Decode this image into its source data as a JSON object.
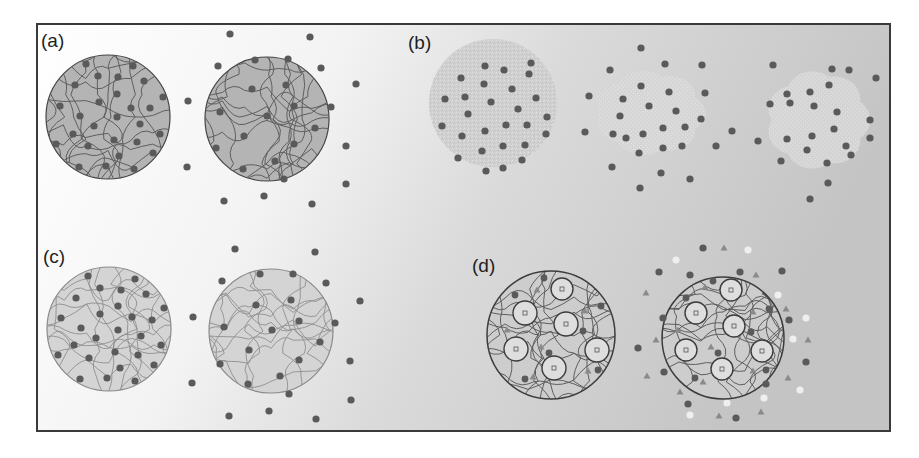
{
  "figure": {
    "frame": {
      "x": 37,
      "y": 24,
      "width": 853,
      "height": 407,
      "stroke": "#3a3a3a"
    },
    "background": {
      "gradient_stops": [
        "#ffffff",
        "#f1f1f1",
        "#d6d6d6",
        "#c2c2c2"
      ]
    },
    "colors": {
      "dot": "#5a5a5a",
      "triangle": "#8a8a8a",
      "light_dot": "#efefef",
      "strand": "#5e5e5e",
      "outline": "#444444",
      "a_fill": "#b4b4b4",
      "b_fill": "#cfcfcf",
      "c_fill": "#d4d4d4",
      "d_fill": "#cdcdcd",
      "d_inner_fill": "#dedede"
    },
    "panels": [
      {
        "label": "(a)",
        "label_pos": [
          41,
          47
        ],
        "description": "Dense gray sphere with polymer network and loaded dots; swollen sphere releasing dots",
        "spheres": [
          {
            "cx": 108,
            "cy": 117,
            "r": 62,
            "style": "network-dark"
          },
          {
            "cx": 267,
            "cy": 119,
            "r": 62,
            "style": "network-dark"
          }
        ],
        "dots_inside": [
          [
            [
              86,
              64
            ],
            [
              133,
              66
            ],
            [
              98,
              76
            ],
            [
              118,
              77
            ],
            [
              144,
              81
            ],
            [
              75,
              85
            ],
            [
              117,
              94
            ],
            [
              60,
              106
            ],
            [
              99,
              102
            ],
            [
              131,
              108
            ],
            [
              150,
              108
            ],
            [
              163,
              97
            ],
            [
              80,
              116
            ],
            [
              117,
              117
            ],
            [
              94,
              126
            ],
            [
              140,
              124
            ],
            [
              73,
              134
            ],
            [
              114,
              140
            ],
            [
              137,
              142
            ],
            [
              160,
              134
            ],
            [
              56,
              144
            ],
            [
              88,
              146
            ],
            [
              153,
              153
            ],
            [
              119,
              156
            ],
            [
              79,
              167
            ],
            [
              106,
              166
            ],
            [
              134,
              169
            ]
          ],
          [
            [
              255,
              60
            ],
            [
              288,
              59
            ],
            [
              252,
              89
            ],
            [
              286,
              85
            ],
            [
              220,
              112
            ],
            [
              294,
              106
            ],
            [
              267,
              116
            ],
            [
              315,
              128
            ],
            [
              244,
              136
            ],
            [
              294,
              144
            ],
            [
              216,
              148
            ],
            [
              275,
              161
            ],
            [
              243,
              169
            ]
          ]
        ],
        "dots_outside": [
          [
            230,
            34
          ],
          [
            310,
            37
          ],
          [
            218,
            66
          ],
          [
            321,
            68
          ],
          [
            356,
            84
          ],
          [
            188,
            101
          ],
          [
            331,
            107
          ],
          [
            346,
            146
          ],
          [
            187,
            167
          ],
          [
            284,
            179
          ],
          [
            346,
            184
          ],
          [
            224,
            201
          ],
          [
            264,
            196
          ],
          [
            312,
            204
          ]
        ]
      },
      {
        "label": "(b)",
        "label_pos": [
          408,
          49
        ],
        "description": "Nanoparticle cluster that fragments and disperses over time",
        "spheres": [
          {
            "cx": 493,
            "cy": 103,
            "r": 64,
            "style": "speckled"
          }
        ],
        "blobs": [
          {
            "cx": 650,
            "cy": 113,
            "rx": 62,
            "ry": 50
          },
          {
            "cx": 818,
            "cy": 120,
            "rx": 58,
            "ry": 58
          }
        ],
        "dots_inside": [
          [
            [
              485,
              66
            ],
            [
              504,
              70
            ],
            [
              529,
              74
            ],
            [
              461,
              78
            ],
            [
              484,
              84
            ],
            [
              512,
              89
            ],
            [
              445,
              99
            ],
            [
              465,
              97
            ],
            [
              491,
              102
            ],
            [
              518,
              109
            ],
            [
              536,
              98
            ],
            [
              468,
              114
            ],
            [
              547,
              117
            ],
            [
              442,
              126
            ],
            [
              506,
              125
            ],
            [
              527,
              125
            ],
            [
              462,
              136
            ],
            [
              485,
              131
            ],
            [
              546,
              134
            ],
            [
              482,
              151
            ],
            [
              503,
              146
            ],
            [
              525,
              145
            ],
            [
              458,
              158
            ],
            [
              522,
              160
            ],
            [
              486,
              171
            ],
            [
              503,
              168
            ]
          ]
        ],
        "dots_outside": [
          [
            641,
            48
          ],
          [
            531,
            63
          ],
          [
            610,
            70
          ],
          [
            665,
            64
          ],
          [
            702,
            65
          ],
          [
            773,
            65
          ],
          [
            832,
            69
          ],
          [
            849,
            70
          ],
          [
            876,
            78
          ],
          [
            589,
            96
          ],
          [
            623,
            99
          ],
          [
            641,
            86
          ],
          [
            669,
            92
          ],
          [
            705,
            93
          ],
          [
            787,
            94
          ],
          [
            810,
            92
          ],
          [
            829,
            85
          ],
          [
            620,
            116
          ],
          [
            649,
            106
          ],
          [
            676,
            111
          ],
          [
            701,
            119
          ],
          [
            770,
            104
          ],
          [
            790,
            103
          ],
          [
            814,
            106
          ],
          [
            837,
            112
          ],
          [
            613,
            134
          ],
          [
            626,
            138
          ],
          [
            663,
            128
          ],
          [
            685,
            127
          ],
          [
            732,
            131
          ],
          [
            834,
            129
          ],
          [
            870,
            120
          ],
          [
            870,
            138
          ],
          [
            585,
            132
          ],
          [
            643,
            134
          ],
          [
            663,
            148
          ],
          [
            682,
            146
          ],
          [
            716,
            146
          ],
          [
            758,
            141
          ],
          [
            787,
            139
          ],
          [
            812,
            136
          ],
          [
            807,
            150
          ],
          [
            846,
            146
          ],
          [
            612,
            167
          ],
          [
            639,
            153
          ],
          [
            661,
            173
          ],
          [
            690,
            179
          ],
          [
            781,
            161
          ],
          [
            827,
            163
          ],
          [
            851,
            155
          ],
          [
            640,
            188
          ],
          [
            828,
            183
          ],
          [
            810,
            199
          ]
        ]
      },
      {
        "label": "(c)",
        "label_pos": [
          43,
          263
        ],
        "description": "Light sphere with sparse network, swollen and releasing dots",
        "spheres": [
          {
            "cx": 109,
            "cy": 329,
            "r": 62,
            "style": "network-light"
          },
          {
            "cx": 271,
            "cy": 331,
            "r": 62,
            "style": "network-light"
          }
        ],
        "dots_inside": [
          [
            [
              88,
              276
            ],
            [
              135,
              279
            ],
            [
              100,
              288
            ],
            [
              121,
              290
            ],
            [
              146,
              294
            ],
            [
              76,
              298
            ],
            [
              118,
              306
            ],
            [
              61,
              318
            ],
            [
              100,
              314
            ],
            [
              132,
              317
            ],
            [
              152,
              320
            ],
            [
              164,
              308
            ],
            [
              81,
              328
            ],
            [
              118,
              330
            ],
            [
              96,
              338
            ],
            [
              141,
              336
            ],
            [
              74,
              345
            ],
            [
              115,
              352
            ],
            [
              138,
              355
            ],
            [
              161,
              345
            ],
            [
              58,
              355
            ],
            [
              89,
              358
            ],
            [
              154,
              365
            ],
            [
              120,
              368
            ],
            [
              80,
              379
            ],
            [
              107,
              378
            ],
            [
              135,
              381
            ]
          ]
        ],
        "dots_outside": [
          [
            235,
            249
          ],
          [
            315,
            252
          ],
          [
            222,
            281
          ],
          [
            326,
            283
          ],
          [
            360,
            301
          ],
          [
            193,
            317
          ],
          [
            335,
            323
          ],
          [
            350,
            361
          ],
          [
            192,
            383
          ],
          [
            289,
            394
          ],
          [
            351,
            400
          ],
          [
            229,
            416
          ],
          [
            269,
            411
          ],
          [
            316,
            419
          ],
          [
            260,
            274
          ],
          [
            293,
            274
          ],
          [
            256,
            305
          ],
          [
            291,
            300
          ],
          [
            224,
            327
          ],
          [
            299,
            321
          ],
          [
            272,
            330
          ],
          [
            320,
            342
          ],
          [
            249,
            350
          ],
          [
            299,
            360
          ],
          [
            220,
            364
          ],
          [
            280,
            376
          ],
          [
            248,
            384
          ]
        ]
      },
      {
        "label": "(d)",
        "label_pos": [
          472,
          272
        ],
        "description": "Network sphere with encapsulated vesicles, dots and triangles; swollen and releasing both species",
        "spheres": [
          {
            "cx": 551,
            "cy": 335,
            "r": 64,
            "style": "network-vesicles"
          },
          {
            "cx": 723,
            "cy": 338,
            "r": 61,
            "style": "network-vesicles"
          }
        ],
        "vesicles": [
          [
            [
              562,
              289,
              11
            ],
            [
              525,
              313,
              12
            ],
            [
              566,
              324,
              12
            ],
            [
              516,
              349,
              12
            ],
            [
              597,
              350,
              12
            ],
            [
              554,
              368,
              12
            ]
          ],
          [
            [
              731,
              290,
              11
            ],
            [
              696,
              313,
              11
            ],
            [
              734,
              326,
              11
            ],
            [
              686,
              350,
              11
            ],
            [
              762,
              351,
              11
            ],
            [
              722,
              369,
              11
            ]
          ]
        ],
        "dots_inside": [
          [
            [
              544,
              278
            ],
            [
              515,
              295
            ],
            [
              601,
              306
            ],
            [
              583,
              331
            ],
            [
              549,
              353
            ],
            [
              598,
              370
            ],
            [
              525,
              379
            ]
          ],
          [
            [
              713,
              281
            ],
            [
              686,
              298
            ],
            [
              769,
              309
            ],
            [
              751,
              332
            ],
            [
              718,
              353
            ],
            [
              766,
              370
            ],
            [
              695,
              378
            ]
          ]
        ],
        "triangles_inside": [
          [
            [
              537,
              290
            ],
            [
              585,
              311
            ],
            [
              507,
              330
            ],
            [
              541,
              347
            ],
            [
              588,
              371
            ],
            [
              533,
              377
            ]
          ],
          [
            [
              705,
              287
            ],
            [
              753,
              312
            ],
            [
              678,
              330
            ],
            [
              711,
              347
            ],
            [
              753,
              371
            ],
            [
              703,
              382
            ]
          ]
        ],
        "dots_outside": [
          [
            703,
            248
          ],
          [
            659,
            272
          ],
          [
            690,
            275
          ],
          [
            740,
            272
          ],
          [
            782,
            271
          ],
          [
            663,
            318
          ],
          [
            789,
            320
          ],
          [
            638,
            348
          ],
          [
            806,
            362
          ],
          [
            664,
            372
          ],
          [
            766,
            384
          ],
          [
            688,
            404
          ],
          [
            736,
            418
          ]
        ],
        "triangles_outside": [
          [
            724,
            248
          ],
          [
            756,
            275
          ],
          [
            646,
            293
          ],
          [
            786,
            309
          ],
          [
            656,
            340
          ],
          [
            808,
            340
          ],
          [
            647,
            376
          ],
          [
            788,
            378
          ],
          [
            680,
            392
          ],
          [
            761,
            412
          ],
          [
            719,
            416
          ]
        ],
        "light_dots_outside": [
          [
            748,
            250
          ],
          [
            676,
            260
          ],
          [
            778,
            295
          ],
          [
            677,
            301
          ],
          [
            806,
            318
          ],
          [
            793,
            339
          ],
          [
            669,
            358
          ],
          [
            800,
            390
          ],
          [
            764,
            398
          ],
          [
            727,
            403
          ],
          [
            690,
            415
          ]
        ]
      }
    ]
  }
}
